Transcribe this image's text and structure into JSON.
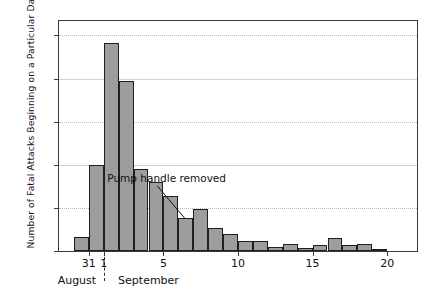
{
  "chart_data": {
    "type": "bar",
    "title": "",
    "subtitle": "",
    "xlabel": "",
    "ylabel": "Number of Fatal Attacks Beginning on a Particular Day",
    "ylim": [
      0,
      160
    ],
    "yticks": [
      0,
      30,
      60,
      90,
      120,
      150
    ],
    "ytick_labels": [
      "0",
      "30",
      "60",
      "90",
      "120",
      "150"
    ],
    "xlim_days": [
      29,
      53
    ],
    "xticks": [
      31,
      32,
      36,
      41,
      46,
      51
    ],
    "xtick_labels": [
      "31",
      "1",
      "5",
      "10",
      "15",
      "20"
    ],
    "grid": "horizontal-dotted",
    "legend": "none",
    "bar_color": "#9d9d9d",
    "bar_edge_color": "#1f1f1f",
    "categories": [
      "Aug 29",
      "Aug 30",
      "Aug 31",
      "Sep 1",
      "Sep 2",
      "Sep 3",
      "Sep 4",
      "Sep 5",
      "Sep 6",
      "Sep 7",
      "Sep 8",
      "Sep 9",
      "Sep 10",
      "Sep 11",
      "Sep 12",
      "Sep 13",
      "Sep 14",
      "Sep 15",
      "Sep 16",
      "Sep 17",
      "Sep 18",
      "Sep 19",
      "Sep 20",
      "Sep 21"
    ],
    "values": [
      0,
      10,
      60,
      145,
      118,
      57,
      48,
      38,
      23,
      29,
      16,
      12,
      7,
      7,
      3,
      5,
      2,
      4,
      9,
      4,
      5,
      1,
      0,
      0
    ],
    "months": [
      {
        "name": "August",
        "center_day": 30.2
      },
      {
        "name": "September",
        "center_day": 35.0
      }
    ],
    "month_separator_day": 32.0,
    "annotations": [
      {
        "text": "Pump handle removed",
        "target_day": 37.6,
        "target_value": 23
      }
    ]
  }
}
